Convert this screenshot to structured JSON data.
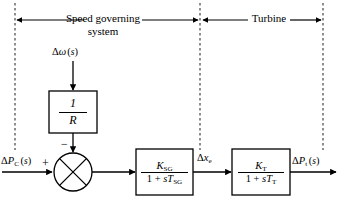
{
  "diagram": {
    "type": "control-system-block-diagram",
    "regions": [
      {
        "id": "speed-governing",
        "label_line1": "Speed governing",
        "label_line2": "system"
      },
      {
        "id": "turbine",
        "label_line1": "Turbine",
        "label_line2": ""
      }
    ],
    "blocks": [
      {
        "id": "droop",
        "numerator": "1",
        "denominator": "R"
      },
      {
        "id": "speed-governor",
        "numerator": "K",
        "numerator_sub": "SG",
        "denominator_prefix": "1 + ",
        "denominator_s": "s",
        "denominator_T": "T",
        "denominator_sub": "SG"
      },
      {
        "id": "turbine",
        "numerator": "K",
        "numerator_sub": "T",
        "denominator_prefix": "1 + ",
        "denominator_s": "s",
        "denominator_T": "T",
        "denominator_sub": "T"
      }
    ],
    "signals": {
      "speed_deviation": {
        "delta": "Δ",
        "symbol": "ω",
        "arg": "(s)"
      },
      "power_command": {
        "delta": "Δ",
        "symbol": "P",
        "sub": "C",
        "arg": "(s)"
      },
      "valve_position": {
        "delta": "Δ",
        "symbol": "x",
        "sub": "e"
      },
      "turbine_power": {
        "delta": "Δ",
        "symbol": "P",
        "sub": "t",
        "arg": "(s)"
      }
    },
    "summing_junction": {
      "plus_sign": "+",
      "minus_sign": "−"
    },
    "colors": {
      "stroke": "#000000",
      "background": "#ffffff",
      "dashed": "#4d4d4d"
    }
  }
}
